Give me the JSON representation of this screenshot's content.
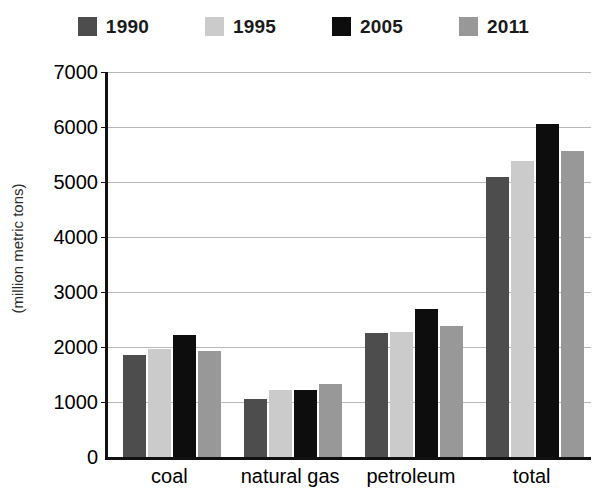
{
  "chart_data": {
    "type": "bar",
    "title": "",
    "xlabel": "",
    "ylabel": "(million metric tons)",
    "ylim": [
      0,
      7000
    ],
    "ytick_values": [
      7000,
      6000,
      5000,
      4000,
      3000,
      2000,
      1000,
      0
    ],
    "ytick_labels": [
      "7000",
      "6000",
      "5000",
      "4000",
      "3000",
      "2000",
      "1000",
      "0"
    ],
    "grid": true,
    "legend_position": "top-center",
    "categories": [
      "coal",
      "natural gas",
      "petroleum",
      "total"
    ],
    "series": [
      {
        "name": "1990",
        "color": "#4d4d4d",
        "values": [
          1850,
          1050,
          2250,
          5100
        ]
      },
      {
        "name": "1995",
        "color": "#cbcbcb",
        "values": [
          1960,
          1220,
          2280,
          5380
        ]
      },
      {
        "name": "2005",
        "color": "#0d0d0d",
        "values": [
          2220,
          1210,
          2700,
          6060
        ]
      },
      {
        "name": "2011",
        "color": "#989898",
        "values": [
          1920,
          1330,
          2380,
          5560
        ]
      }
    ]
  },
  "legend": {
    "items": [
      {
        "label": "1990",
        "color": "#4d4d4d"
      },
      {
        "label": "1995",
        "color": "#cbcbcb"
      },
      {
        "label": "2005",
        "color": "#0d0d0d"
      },
      {
        "label": "2011",
        "color": "#989898"
      }
    ]
  },
  "axes": {
    "y_title": "(million metric tons)"
  }
}
